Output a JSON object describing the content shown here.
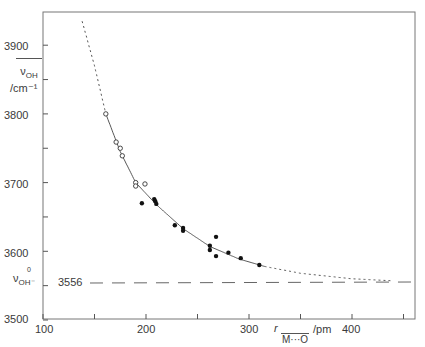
{
  "chart_data": {
    "type": "scatter",
    "title": "",
    "xlabel": "r M···O / pm",
    "xlabel_parts": {
      "symbol": "r",
      "subscript": "M···O",
      "unit": "/pm"
    },
    "ylabel": "ν̄OH / cm⁻¹",
    "ylabel_parts": {
      "symbol": "ν",
      "subscript": "OH",
      "unit": "/cm⁻¹"
    },
    "xlim": [
      100,
      460
    ],
    "ylim": [
      3500,
      3960
    ],
    "x_ticks": [
      100,
      150,
      200,
      250,
      300,
      350,
      400,
      450
    ],
    "x_tick_labels": [
      "100",
      "200",
      "300",
      "400"
    ],
    "y_ticks": [
      3500,
      3550,
      3600,
      3650,
      3700,
      3750,
      3800,
      3850,
      3900
    ],
    "y_tick_labels": [
      "3500",
      "3600",
      "3700",
      "3800",
      "3900"
    ],
    "grid": false,
    "reference_line": {
      "label": "ν⁰OH⁻",
      "value_label": "3556",
      "y": 3556,
      "style": "dashed"
    },
    "series": [
      {
        "name": "open circles",
        "marker": "open-circle",
        "x": [
          161,
          171,
          175,
          177,
          190,
          190,
          199
        ],
        "y": [
          3800,
          3759,
          3750,
          3739,
          3700,
          3695,
          3698
        ]
      },
      {
        "name": "filled circles",
        "marker": "filled-circle",
        "x": [
          196,
          208,
          209,
          210,
          228,
          236,
          236,
          262,
          262,
          268,
          268,
          280,
          292,
          310
        ],
        "y": [
          3670,
          3676,
          3673,
          3669,
          3638,
          3634,
          3630,
          3608,
          3602,
          3621,
          3593,
          3598,
          3590,
          3580
        ]
      },
      {
        "name": "fitted curve",
        "type": "line",
        "style": "solid between ~160 and ~315 pm, dotted extrapolation beyond",
        "x": [
          138,
          150,
          161,
          175,
          190,
          210,
          236,
          262,
          290,
          315,
          350,
          400,
          440
        ],
        "y": [
          3935,
          3870,
          3800,
          3745,
          3700,
          3668,
          3633,
          3607,
          3589,
          3578,
          3568,
          3560,
          3557
        ]
      }
    ]
  },
  "axes": {
    "y_labels": [
      "3900",
      "3800",
      "3700",
      "3600",
      "3500"
    ],
    "x_labels": [
      "100",
      "200",
      "300",
      "400"
    ],
    "y_title_symbol": "ν",
    "y_title_sub": "OH",
    "y_title_unit": "/cm⁻¹",
    "x_title_symbol": "r",
    "x_title_sub": "M···O",
    "x_title_unit": "/pm",
    "ref_symbol": "ν",
    "ref_sup": "0",
    "ref_sub": "OH⁻",
    "ref_value": "3556"
  }
}
